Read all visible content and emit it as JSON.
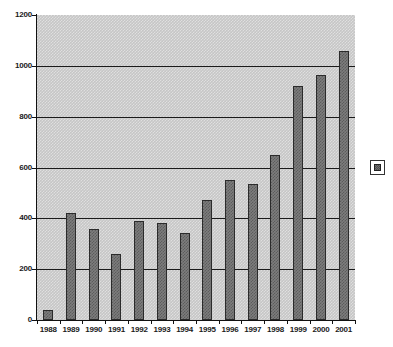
{
  "chart_data": {
    "type": "bar",
    "title": "",
    "subtitle": "",
    "xlabel": "",
    "ylabel": "",
    "categories": [
      "1988",
      "1989",
      "1990",
      "1991",
      "1992",
      "1993",
      "1994",
      "1995",
      "1996",
      "1997",
      "1998",
      "1999",
      "2000",
      "2001"
    ],
    "values": [
      40,
      423,
      360,
      258,
      390,
      383,
      343,
      472,
      550,
      537,
      650,
      920,
      965,
      1060
    ],
    "series": [
      {
        "name": "",
        "values": [
          40,
          423,
          360,
          258,
          390,
          383,
          343,
          472,
          550,
          537,
          650,
          920,
          965,
          1060
        ]
      }
    ],
    "ylim": [
      0,
      1200
    ],
    "y_ticks": [
      0,
      200,
      400,
      600,
      800,
      1000,
      1200
    ],
    "y_tick_labels": [
      "0",
      "200",
      "400",
      "600",
      "800",
      "1000",
      "1200"
    ],
    "gridlines": {
      "horizontal": true,
      "vertical": false,
      "values": [
        200,
        400,
        600,
        800,
        1000
      ]
    },
    "legend": {
      "position": "right",
      "entries": [
        {
          "label": "",
          "swatch_name": "series-swatch"
        }
      ]
    },
    "colors": {
      "plot_background": "#c6c6c6",
      "bar_fill": "#7d7d7d",
      "bar_border": "#2b2b2b",
      "axis": "#111111",
      "gridline": "#1a1a1a",
      "text": "#1a1a1a",
      "page_background": "#ffffff"
    }
  }
}
